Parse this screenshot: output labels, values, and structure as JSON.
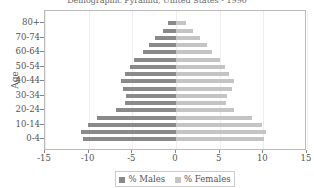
{
  "chart_data": {
    "type": "bar",
    "orientation": "horizontal",
    "title": "Demographic Pyramid, United States - 1990",
    "xlabel": "",
    "ylabel": "Age",
    "xlim": [
      -15,
      15
    ],
    "xticks": [
      -15,
      -10,
      -5,
      0,
      5,
      10,
      15
    ],
    "categories": [
      "0-4",
      "5-9",
      "10-14",
      "15-19",
      "20-24",
      "25-29",
      "30-34",
      "35-39",
      "40-44",
      "45-49",
      "50-54",
      "55-59",
      "60-64",
      "65-69",
      "70-74",
      "75-79",
      "80+"
    ],
    "ytick_labels": [
      "0-4",
      "10-14",
      "20-24",
      "30-34",
      "40-44",
      "50-54",
      "60-64",
      "70-74",
      "80+"
    ],
    "series": [
      {
        "name": "% Males",
        "color": "#8a8a8a",
        "values": [
          -10.6,
          -10.9,
          -10.1,
          -9.0,
          -6.9,
          -5.8,
          -5.7,
          -6.1,
          -6.3,
          -5.8,
          -5.3,
          -4.8,
          -3.8,
          -3.1,
          -2.4,
          -1.5,
          -0.9
        ]
      },
      {
        "name": "% Females",
        "color": "#c4c4c4",
        "values": [
          10.1,
          10.3,
          9.8,
          8.7,
          6.6,
          5.7,
          5.8,
          6.4,
          6.6,
          6.1,
          5.6,
          5.0,
          4.1,
          3.5,
          2.8,
          1.9,
          1.2
        ]
      }
    ],
    "legend_position": "bottom",
    "grid": true
  },
  "legend": {
    "males_label": "% Males",
    "females_label": "% Females"
  },
  "axis": {
    "y_title": "Age"
  }
}
